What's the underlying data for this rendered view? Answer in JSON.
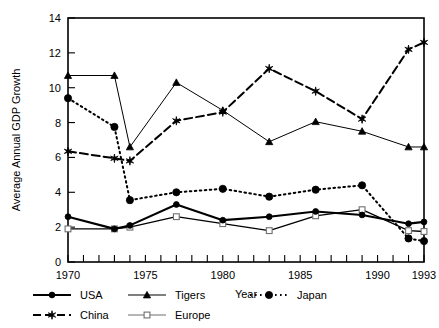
{
  "chart_data": {
    "type": "line",
    "title": "",
    "xlabel": "Year",
    "ylabel": "Average Annual GDP Growth",
    "xlim": [
      1970,
      1993
    ],
    "ylim": [
      0,
      14
    ],
    "ytick_values": [
      0,
      2,
      4,
      6,
      8,
      10,
      12,
      14
    ],
    "ytick_labels": [
      "0",
      "2",
      "4",
      "6",
      "8",
      "10",
      "12",
      "14"
    ],
    "xtick_values": [
      1970,
      1975,
      1980,
      1985,
      1990,
      1993
    ],
    "xtick_labels": [
      "1970",
      "1975",
      "1980",
      "1985",
      "1990",
      "1993"
    ],
    "xtick_minor_values": [
      1971,
      1972,
      1973,
      1974,
      1976,
      1977,
      1978,
      1979,
      1981,
      1982,
      1983,
      1984,
      1986,
      1987,
      1988,
      1989,
      1991,
      1992
    ],
    "grid": false,
    "legend_position": "below-plot",
    "x": [
      1970,
      1973,
      1974,
      1977,
      1980,
      1983,
      1986,
      1989,
      1992,
      1993
    ],
    "series": [
      {
        "name": "USA",
        "marker": "filled-circle",
        "line_style": "solid",
        "line_width": 2.1,
        "color": "#000000",
        "values": [
          2.6,
          1.9,
          2.1,
          3.3,
          2.4,
          2.6,
          2.9,
          2.7,
          2.2,
          2.3
        ]
      },
      {
        "name": "China",
        "marker": "filled-star",
        "line_style": "dashed",
        "line_width": 2.0,
        "color": "#000000",
        "values": [
          6.35,
          5.95,
          5.8,
          8.1,
          8.6,
          11.1,
          9.8,
          8.2,
          12.2,
          12.6
        ]
      },
      {
        "name": "Tigers",
        "marker": "filled-triangle",
        "line_style": "solid",
        "line_width": 1.0,
        "color": "#000000",
        "values": [
          10.7,
          10.7,
          6.6,
          10.3,
          8.7,
          6.9,
          8.05,
          7.5,
          6.6,
          6.6
        ]
      },
      {
        "name": "Europe",
        "marker": "open-square",
        "line_style": "solid",
        "line_width": 1.3,
        "color": "#6f6f6f",
        "values": [
          1.9,
          1.9,
          2.0,
          2.6,
          2.2,
          1.8,
          2.65,
          3.0,
          1.8,
          1.75
        ]
      },
      {
        "name": "Japan",
        "marker": "filled-circle-large",
        "line_style": "dotted",
        "line_width": 2.0,
        "color": "#000000",
        "values": [
          9.4,
          7.75,
          3.55,
          4.0,
          4.2,
          3.75,
          4.15,
          4.4,
          1.35,
          1.2
        ]
      }
    ],
    "legend": [
      {
        "label": "USA",
        "marker": "filled-circle",
        "line_style": "solid",
        "row": 0,
        "col": 0
      },
      {
        "label": "Tigers",
        "marker": "filled-triangle",
        "line_style": "solid",
        "row": 0,
        "col": 1
      },
      {
        "label": "Japan",
        "marker": "filled-circle-large",
        "line_style": "dotted",
        "row": 0,
        "col": 2
      },
      {
        "label": "China",
        "marker": "filled-star",
        "line_style": "dashed",
        "row": 1,
        "col": 0
      },
      {
        "label": "Europe",
        "marker": "open-square",
        "line_style": "solid",
        "row": 1,
        "col": 1
      }
    ]
  }
}
